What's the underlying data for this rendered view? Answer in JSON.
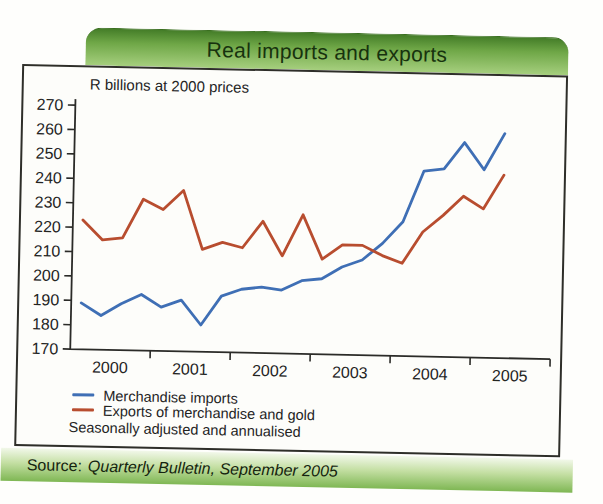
{
  "header": {
    "title": "Real imports and exports"
  },
  "chart": {
    "unit_label": "R billions at 2000 prices",
    "footnote": "Seasonally adjusted and annualised"
  },
  "chart_data": {
    "type": "line",
    "title": "Real imports and exports",
    "subtitle": "R billions at 2000 prices",
    "x": [
      "2000Q1",
      "2000Q2",
      "2000Q3",
      "2000Q4",
      "2001Q1",
      "2001Q2",
      "2001Q3",
      "2001Q4",
      "2002Q1",
      "2002Q2",
      "2002Q3",
      "2002Q4",
      "2003Q1",
      "2003Q2",
      "2003Q3",
      "2003Q4",
      "2004Q1",
      "2004Q2",
      "2004Q3",
      "2004Q4",
      "2005Q1",
      "2005Q2"
    ],
    "series": [
      {
        "name": "Merchandise imports",
        "color": "#3f6fb5",
        "values": [
          189,
          184,
          189,
          193,
          188,
          191,
          181,
          193,
          196,
          197,
          196,
          200,
          201,
          206,
          209,
          216,
          225,
          246,
          247,
          258,
          247,
          262
        ]
      },
      {
        "name": "Exports of merchandise and gold",
        "color": "#b84d2f",
        "values": [
          223,
          215,
          216,
          232,
          228,
          236,
          212,
          215,
          213,
          224,
          210,
          227,
          209,
          215,
          215,
          211,
          208,
          221,
          228,
          236,
          231,
          245
        ]
      }
    ],
    "ylim": [
      170,
      270
    ],
    "y_ticks": [
      270,
      260,
      250,
      240,
      230,
      220,
      210,
      200,
      190,
      180,
      170
    ],
    "x_tick_labels": [
      "2000",
      "2001",
      "2002",
      "2003",
      "2004",
      "2005"
    ],
    "grid": false,
    "legend_position": "bottom-left",
    "footnote": "Seasonally adjusted and annualised"
  },
  "footer": {
    "source_label": "Source:",
    "source_text": "Quarterly Bulletin, September 2005"
  },
  "palette": {
    "banner_green_top": "#447d28",
    "banner_green_bottom": "#a6cf7e",
    "source_bar_green": "#7fb754",
    "imports_blue": "#3f6fb5",
    "exports_red": "#b84d2f",
    "border_black": "#2e2e29",
    "title_text": "#17320e",
    "axis_color": "#2b2b28"
  }
}
